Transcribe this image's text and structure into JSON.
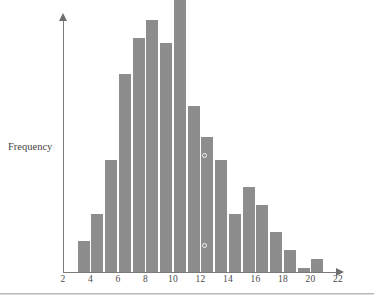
{
  "chart_data": {
    "type": "bar",
    "title": "",
    "xlabel": "",
    "ylabel": "Frequency",
    "grid": false,
    "legend": "none",
    "xlim": [
      2,
      22
    ],
    "ylim": [
      0,
      56
    ],
    "xticks": [
      "2",
      "4",
      "6",
      "8",
      "10",
      "12",
      "14",
      "16",
      "18",
      "20",
      "22"
    ],
    "bin_width": 1,
    "bin_starts": [
      3,
      4,
      5,
      6,
      7,
      8,
      9,
      10,
      11,
      12,
      13,
      14,
      15,
      16,
      17,
      18,
      19,
      20
    ],
    "categories": [
      "3-4",
      "4-5",
      "5-6",
      "6-7",
      "7-8",
      "8-9",
      "9-10",
      "10-11",
      "11-12",
      "12-13",
      "13-14",
      "14-15",
      "15-16",
      "16-17",
      "17-18",
      "18-19",
      "19-20",
      "20-21"
    ],
    "values": [
      7,
      13,
      25,
      44,
      52,
      56,
      51,
      62,
      37,
      30,
      25,
      13,
      19,
      15,
      9,
      5,
      1,
      3
    ],
    "bar_color": "#8d8d8d",
    "annotations": [
      {
        "name": "marker-upper",
        "x": 12.3,
        "y": 26,
        "shape": "open-circle"
      },
      {
        "name": "marker-lower",
        "x": 12.3,
        "y": 6,
        "shape": "open-circle"
      }
    ]
  },
  "axes": {
    "y_axis_arrow": "arrow-up",
    "x_axis_arrow": "arrow-right"
  }
}
